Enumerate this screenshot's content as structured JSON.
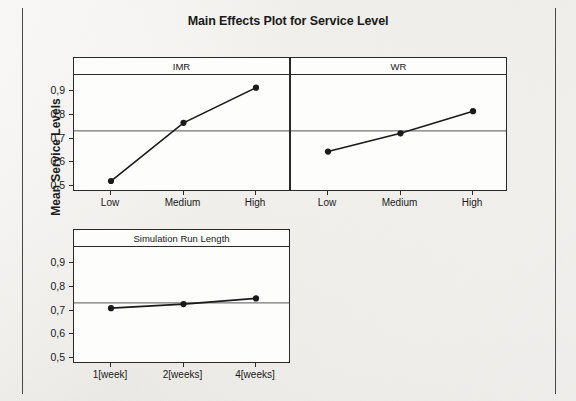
{
  "chart_data": {
    "type": "line",
    "title": "Main Effects Plot for Service Level",
    "ylabel": "Mean Service Levels",
    "xlabel": "",
    "ylim": [
      0.5,
      0.95
    ],
    "yticks": [
      "0,5",
      "0,6",
      "0,7",
      "0,8",
      "0,9"
    ],
    "ytick_values": [
      0.5,
      0.6,
      0.7,
      0.8,
      0.9
    ],
    "grid": false,
    "reference_line": 0.732,
    "legend": "",
    "panels": [
      {
        "name": "IMR",
        "categories": [
          "Low",
          "Medium",
          "High"
        ],
        "values": [
          0.521,
          0.766,
          0.914
        ]
      },
      {
        "name": "WR",
        "categories": [
          "Low",
          "Medium",
          "High"
        ],
        "values": [
          0.645,
          0.722,
          0.815
        ]
      },
      {
        "name": "Simulation Run Length",
        "categories": [
          "1[week]",
          "2[weeks]",
          "4[weeks]"
        ],
        "values": [
          0.71,
          0.727,
          0.751
        ]
      }
    ],
    "marker": "filled-circle",
    "line_color": "#1a1a1a",
    "reference_line_color": "#555555"
  }
}
